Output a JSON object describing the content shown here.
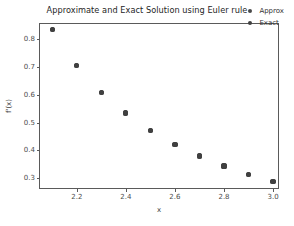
{
  "chart_data": {
    "type": "scatter",
    "title": "Approximate and Exact Solution using Euler rule",
    "xlabel": "x",
    "ylabel": "f'(x)",
    "grid": false,
    "legend_position": "upper right",
    "xlim": [
      2.05,
      3.02
    ],
    "ylim": [
      0.265,
      0.855
    ],
    "xticks": [
      "2.2",
      "2.4",
      "2.6",
      "2.8",
      "3.0"
    ],
    "xtick_values": [
      2.2,
      2.4,
      2.6,
      2.8,
      3.0
    ],
    "yticks": [
      "0.3",
      "0.4",
      "0.5",
      "0.6",
      "0.7",
      "0.8"
    ],
    "ytick_values": [
      0.3,
      0.4,
      0.5,
      0.6,
      0.7,
      0.8
    ],
    "x": [
      2.1,
      2.2,
      2.3,
      2.4,
      2.5,
      2.6,
      2.7,
      2.8,
      2.9,
      3.0
    ],
    "series": [
      {
        "name": "Approx",
        "color": "#4a4a4a",
        "values": [
          0.835,
          0.707,
          0.61,
          0.535,
          0.473,
          0.422,
          0.38,
          0.344,
          0.314,
          0.288
        ]
      },
      {
        "name": "Exact",
        "color": "#404040",
        "values": [
          0.835,
          0.707,
          0.61,
          0.535,
          0.473,
          0.422,
          0.38,
          0.344,
          0.314,
          0.288
        ]
      }
    ]
  },
  "colors": {
    "background": "#ffffff",
    "axis": "#5a5a5a",
    "text": "#333333",
    "marker": "#404040"
  }
}
